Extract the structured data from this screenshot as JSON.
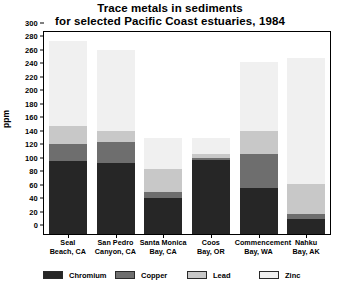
{
  "chart_data": {
    "type": "bar",
    "subtype": "stacked-bar",
    "title": "Trace metals in sediments for selected Pacific Coast estuaries, 1984",
    "title_lines": [
      "Trace metals in sediments",
      "for selected Pacific Coast estuaries, 1984"
    ],
    "xlabel": "",
    "ylabel": "ppm",
    "ylim": [
      0,
      300
    ],
    "ytick_step": 20,
    "yticks": [
      0,
      20,
      40,
      60,
      80,
      100,
      120,
      140,
      160,
      180,
      200,
      220,
      240,
      260,
      280,
      300
    ],
    "grid": false,
    "legend_position": "bottom",
    "categories": [
      "Seal Beach, CA",
      "San Pedro Canyon, CA",
      "Santa Monica Bay, CA",
      "Coos Bay, OR",
      "Commencement Bay, WA",
      "Nahku Bay, AK"
    ],
    "category_lines": [
      [
        "Seal",
        "Beach, CA"
      ],
      [
        "San Pedro",
        "Canyon, CA"
      ],
      [
        "Santa Monica",
        "Bay, CA"
      ],
      [
        "Coos",
        "Bay, OR"
      ],
      [
        "Commencement",
        "Bay, WA"
      ],
      [
        "Nahku",
        "Bay, AK"
      ]
    ],
    "series": [
      {
        "name": "Chromium",
        "color": "#262626",
        "values": [
          108,
          105,
          53,
          110,
          68,
          22
        ]
      },
      {
        "name": "Copper",
        "color": "#6e6e6e",
        "values": [
          25,
          32,
          10,
          3,
          51,
          8
        ]
      },
      {
        "name": "Lead",
        "color": "#c8c8c8",
        "values": [
          27,
          16,
          33,
          6,
          34,
          44
        ]
      },
      {
        "name": "Zinc",
        "color": "#f0f0f0",
        "values": [
          126,
          120,
          47,
          24,
          102,
          188
        ]
      }
    ],
    "totals": [
      286,
      273,
      143,
      143,
      255,
      262
    ]
  }
}
